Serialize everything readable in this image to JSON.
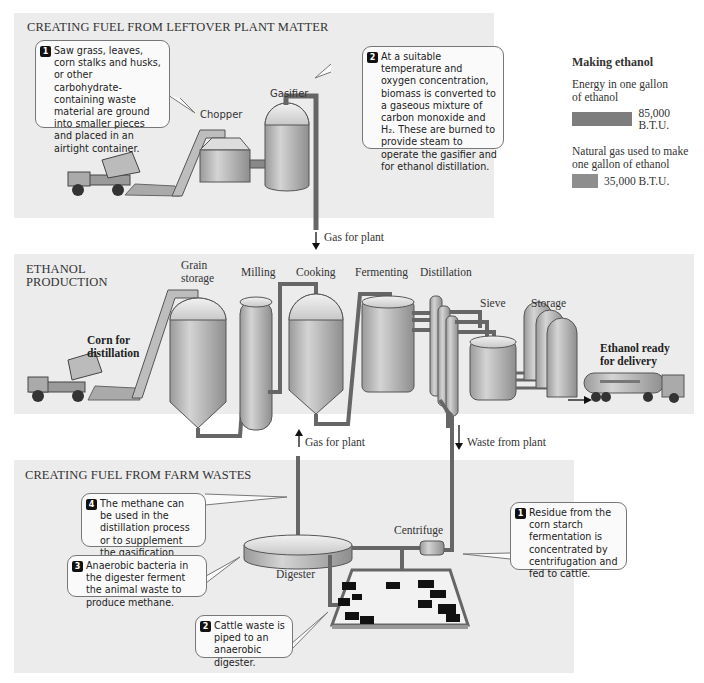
{
  "sections": {
    "plant_matter": {
      "title": "CREATING FUEL FROM LEFTOVER PLANT MATTER",
      "labels": {
        "chopper": "Chopper",
        "gasifier": "Gasifier"
      },
      "callouts": [
        {
          "num": "1",
          "text": "Saw grass, leaves, corn stalks and husks, or other carbohydrate-containing waste material are ground into smaller pieces and placed in an airtight container."
        },
        {
          "num": "2",
          "text": "At a suitable temperature and oxygen concentration, biomass is converted to a gaseous mixture of carbon monoxide and H₂. These are burned to provide steam to operate the gasifier and for ethanol distillation."
        }
      ]
    },
    "ethanol_production": {
      "title_line1": "ETHANOL",
      "title_line2": "PRODUCTION",
      "labels": {
        "grain_storage_1": "Grain",
        "grain_storage_2": "storage",
        "milling": "Milling",
        "cooking": "Cooking",
        "fermenting": "Fermenting",
        "distillation": "Distillation",
        "sieve": "Sieve",
        "storage": "Storage",
        "corn_1": "Corn for",
        "corn_2": "distillation",
        "ready_1": "Ethanol ready",
        "ready_2": "for delivery"
      }
    },
    "farm_wastes": {
      "title": "CREATING FUEL FROM FARM WASTES",
      "labels": {
        "digester": "Digester",
        "centrifuge": "Centrifuge"
      },
      "callouts": [
        {
          "num": "4",
          "text": "The methane can be used in the distillation process or to supplement the gasification process."
        },
        {
          "num": "3",
          "text": "Anaerobic bacteria in the digester ferment the animal waste to produce methane."
        },
        {
          "num": "2",
          "text": "Cattle waste is piped to an anaerobic digester."
        },
        {
          "num": "1",
          "text": "Residue from the corn starch fermentation is concentrated by centrifugation and fed to cattle."
        }
      ]
    }
  },
  "flows": {
    "gas_for_plant_down": "Gas for plant",
    "gas_for_plant_up": "Gas for plant",
    "waste_from_plant": "Waste from plant"
  },
  "legend": {
    "title": "Making ethanol",
    "items": [
      {
        "label": "Energy in one gallon of ethanol",
        "value": "85,000 B.T.U.",
        "btu": 85000
      },
      {
        "label": "Natural gas used to make one gallon of ethanol",
        "value": "35,000 B.T.U.",
        "btu": 35000
      }
    ]
  },
  "colors": {
    "panel": "#ececec",
    "pipe": "#7a7a7a",
    "tank": "#b8b8b8",
    "bar": "#8a8a8a"
  }
}
